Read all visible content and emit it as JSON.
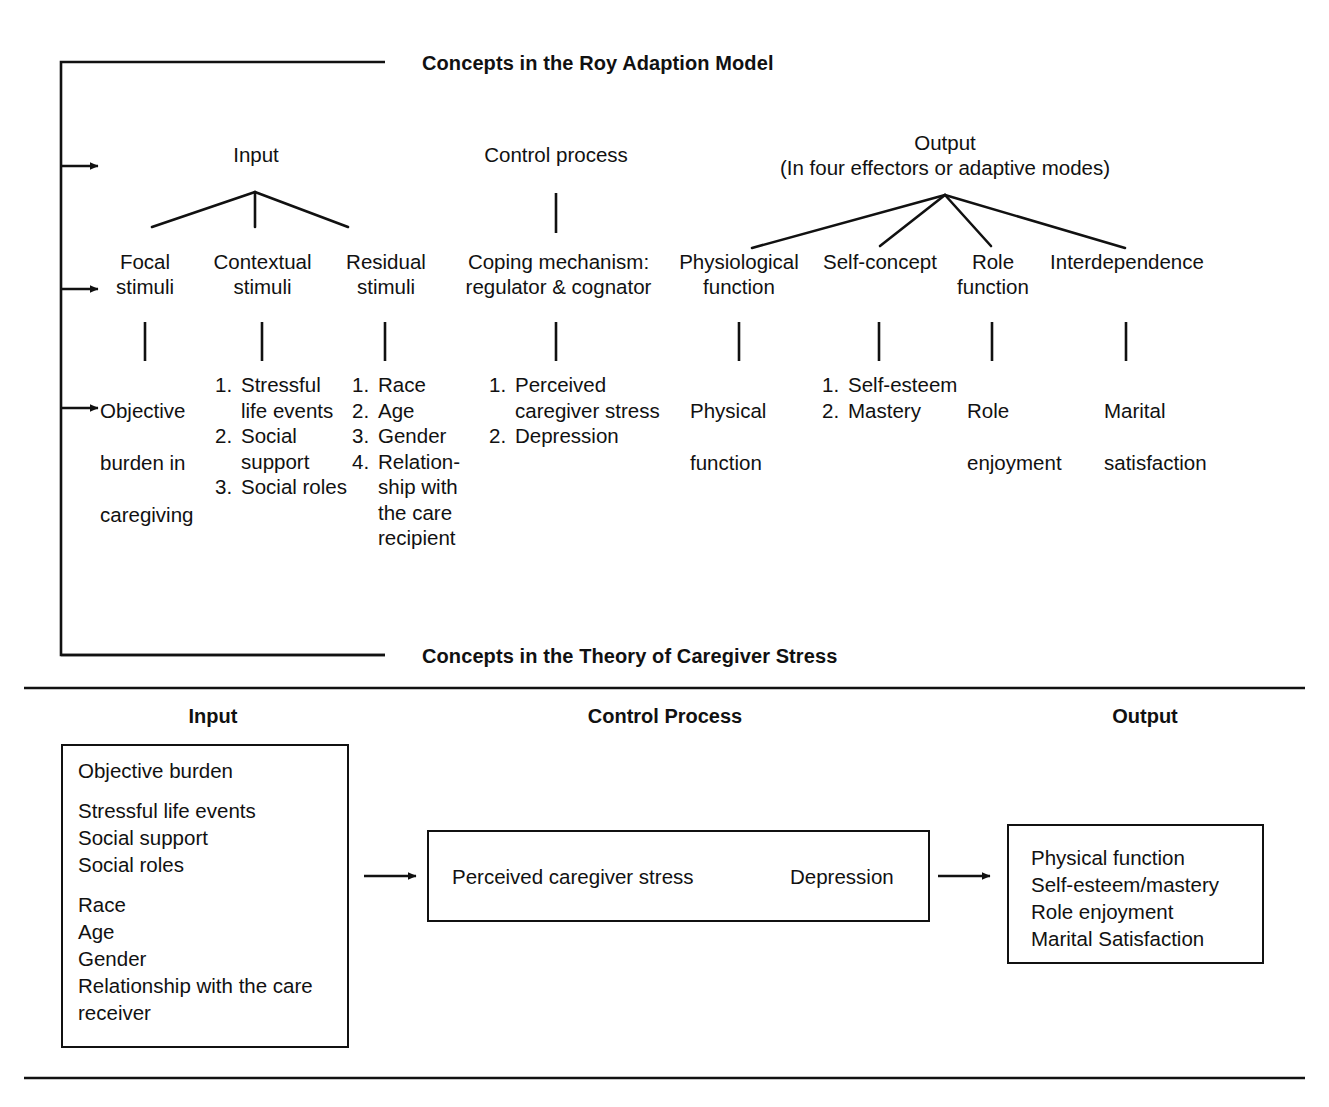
{
  "figure": {
    "top_section_title": "Concepts in the Roy Adaption Model",
    "bottom_section_title": "Concepts in the Theory of Caregiver Stress"
  },
  "roy_model": {
    "groups": {
      "input": {
        "title": "Input"
      },
      "control": {
        "title": "Control process"
      },
      "output": {
        "title": "Output",
        "subtitle": "(In four effectors or adaptive modes)"
      }
    },
    "level2": [
      {
        "label": "Focal\nstimuli"
      },
      {
        "label": "Contextual\nstimuli"
      },
      {
        "label": "Residual\nstimuli"
      },
      {
        "label": "Coping mechanism:\nregulator & cognator"
      },
      {
        "label": "Physiological\nfunction"
      },
      {
        "label": "Self-concept"
      },
      {
        "label": "Role\nfunction"
      },
      {
        "label": "Interdependence"
      }
    ],
    "level3": [
      {
        "type": "plain",
        "lines": [
          "Objective",
          "burden in",
          "caregiving"
        ]
      },
      {
        "type": "numbered",
        "items": [
          "Stressful life events",
          "Social support",
          "Social roles"
        ]
      },
      {
        "type": "numbered",
        "items": [
          "Race",
          "Age",
          "Gender",
          "Relation-ship with the care recipient"
        ]
      },
      {
        "type": "numbered",
        "items": [
          "Perceived caregiver stress",
          "Depression"
        ]
      },
      {
        "type": "plain",
        "lines": [
          "Physical",
          "function"
        ]
      },
      {
        "type": "numbered",
        "items": [
          "Self-esteem",
          "Mastery"
        ]
      },
      {
        "type": "plain",
        "lines": [
          "Role",
          "enjoyment"
        ]
      },
      {
        "type": "plain",
        "lines": [
          "Marital",
          "satisfaction"
        ]
      }
    ]
  },
  "caregiver_theory": {
    "column_headers": {
      "input": "Input",
      "control": "Control Process",
      "output": "Output"
    },
    "input_box": {
      "group1": [
        "Objective burden"
      ],
      "group2": [
        "Stressful life events",
        "Social support",
        "Social roles"
      ],
      "group3": [
        "Race",
        "Age",
        "Gender",
        "Relationship with the care",
        "receiver"
      ]
    },
    "control_box": {
      "first": "Perceived caregiver stress",
      "second": "Depression"
    },
    "output_box": {
      "items": [
        "Physical function",
        "Self-esteem/mastery",
        "Role enjoyment",
        "Marital Satisfaction"
      ]
    }
  },
  "colors": {
    "ink": "#111111",
    "paper": "#ffffff"
  }
}
